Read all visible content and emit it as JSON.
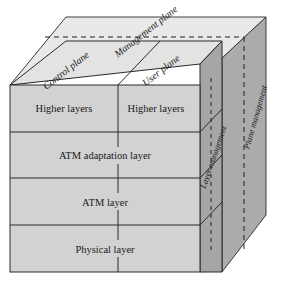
{
  "figure": {
    "colors": {
      "front_face": "#d2d2d2",
      "top_face": "#e6e6e6",
      "right_face": "#a9a9a9",
      "back_panel": "#b6b6b6",
      "line": "#1a1a1a",
      "text": "#1a1a1a",
      "background": "#ffffff"
    }
  },
  "top_face": {
    "management_plane_label": "Management plane",
    "control_plane_label": "Control plane",
    "user_plane_label": "User plane"
  },
  "front_face": {
    "layers": [
      {
        "control": "Higher layers",
        "user": "Higher layers",
        "split": true
      },
      {
        "control": "ATM adaptation layer",
        "user": "",
        "split": false
      },
      {
        "control": "ATM layer",
        "user": "",
        "split": false
      },
      {
        "control": "Physical layer",
        "user": "",
        "split": false
      }
    ]
  },
  "side_face": {
    "layer_management_label": "Layer management",
    "plane_management_label": "Plane management"
  }
}
